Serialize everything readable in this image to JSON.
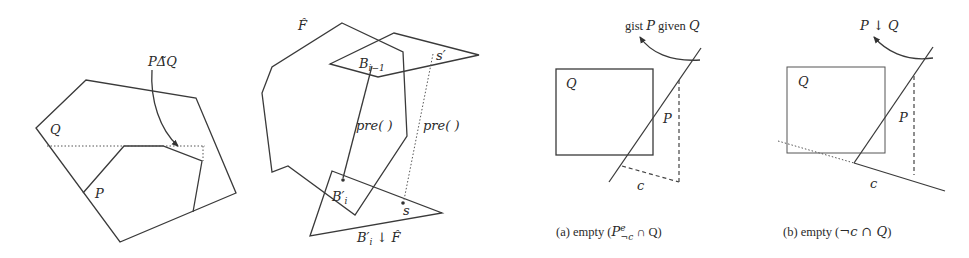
{
  "figure": {
    "panels": [
      {
        "id": "symmetric-difference",
        "labels": {
          "outer_polygon": "Q",
          "inner_polygon": "P",
          "operator": "PΔ̃Q"
        }
      },
      {
        "id": "preimage-diagram",
        "labels": {
          "outer_polygon": "F̂",
          "top_region": "B",
          "top_region_sub": "i−1",
          "bottom_region": "B′",
          "bottom_region_sub": "i",
          "pre_solid": "pre( )",
          "pre_dotted": "pre( )",
          "point_top": "s′",
          "point_bottom": "s",
          "restriction_main": "B′",
          "restriction_sub": "i",
          "restriction_op": " ↓ F̂"
        }
      },
      {
        "id": "panel-a",
        "labels": {
          "box": "Q",
          "halfplane": "P",
          "constraint": "c",
          "annotation": "gist P given Q",
          "annotation_pre": "gist ",
          "annotation_P": "P",
          "annotation_mid": " given ",
          "annotation_Q": "Q",
          "caption_prefix": "(a) empty (",
          "caption_math": "P",
          "caption_sup": "e",
          "caption_sub": "¬c",
          "caption_suffix": " ∩ Q)"
        }
      },
      {
        "id": "panel-b",
        "labels": {
          "box": "Q",
          "halfplane": "P",
          "constraint": "c",
          "annotation": "P ↓ Q",
          "caption_prefix": "(b) empty (",
          "caption_math": "¬c ∩ Q",
          "caption_suffix": ")"
        }
      }
    ],
    "colors": {
      "line": "#3a3a3a",
      "background": "#ffffff"
    }
  }
}
